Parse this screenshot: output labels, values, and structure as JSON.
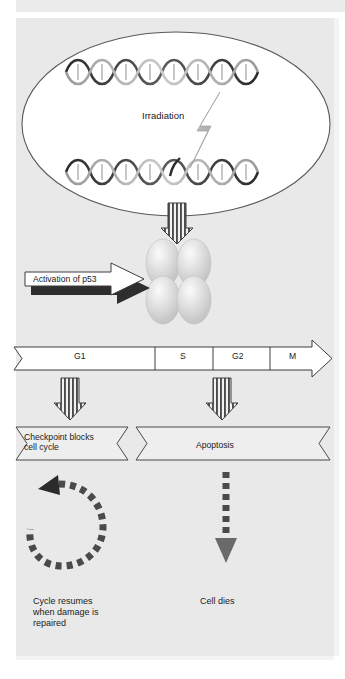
{
  "figure": {
    "background_color": "#e9e9ea",
    "stroke_color": "#4a4a4a",
    "text_color": "#1b1b1b"
  },
  "nucleus": {
    "name": "nucleus",
    "fill": "#ffffff",
    "dna_top_label": "DNA double helix",
    "dna_bottom_label": "damaged DNA double helix",
    "irradiation_label": "Irradiation",
    "bolt_label": "lightning-bolt"
  },
  "p53": {
    "activation_label": "Activation of p53",
    "tetramer_label": "p53 tetramer",
    "subunit_count": 4,
    "fill": "#d8d8d8"
  },
  "cell_cycle": {
    "label": "cell cycle phases",
    "phases": [
      {
        "label": "G1"
      },
      {
        "label": "S"
      },
      {
        "label": "G2"
      },
      {
        "label": "M"
      }
    ]
  },
  "outcomes": [
    {
      "banner": "Checkpoint blocks\ncell cycle",
      "banner_line1": "Checkpoint blocks",
      "banner_line2": "cell cycle",
      "arrow": "dashed-circular-arrow",
      "caption": "Cycle resumes\nwhen damage is\nrepaired"
    },
    {
      "banner": "Apoptosis",
      "banner_line1": "Apoptosis",
      "banner_line2": "",
      "arrow": "dashed-down-arrow",
      "caption": "Cell dies"
    }
  ],
  "arrows": {
    "striped_down_label": "striped-down-arrow",
    "count": 3
  }
}
